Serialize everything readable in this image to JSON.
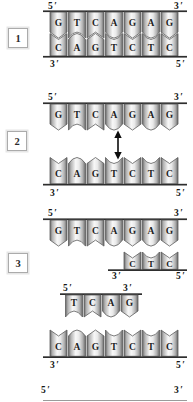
{
  "colors": {
    "background": "#ffffff",
    "backbone_line": "#2e2e2e",
    "tile_edge": "#696969",
    "tile_highlight": "#f8f8f8",
    "letter": "#1e1e1e"
  },
  "steps": [
    {
      "number": "1",
      "top_strand": {
        "label_left": "5′",
        "label_right": "3′",
        "bases": [
          "G",
          "T",
          "C",
          "A",
          "G",
          "A",
          "G"
        ]
      },
      "bottom_strand": {
        "label_left": "3′",
        "label_right": "5′",
        "bases": [
          "C",
          "A",
          "G",
          "T",
          "C",
          "T",
          "C"
        ]
      }
    },
    {
      "number": "2",
      "top_strand": {
        "label_left": "5′",
        "label_right": "3′",
        "bases": [
          "G",
          "T",
          "C",
          "A",
          "G",
          "A",
          "G"
        ]
      },
      "bottom_strand": {
        "label_left": "3′",
        "label_right": "5′",
        "bases": [
          "C",
          "A",
          "G",
          "T",
          "C",
          "T",
          "C"
        ]
      },
      "separation_arrow": "double-headed-vertical"
    },
    {
      "number": "3",
      "upper": {
        "top_strand": {
          "label_left": "5′",
          "label_right": "3′",
          "bases": [
            "G",
            "T",
            "C",
            "A",
            "G",
            "A",
            "G"
          ]
        },
        "primer": {
          "label_left": "3′",
          "label_right": "5′",
          "bases": [
            "C",
            "T",
            "C"
          ],
          "anneal_columns": [
            5,
            6,
            7
          ]
        }
      },
      "lower": {
        "primer": {
          "label_left": "5′",
          "label_right": "3′",
          "bases": [
            "T",
            "C",
            "A",
            "G"
          ],
          "anneal_columns": [
            2,
            3,
            4,
            5
          ]
        },
        "bottom_strand": {
          "label_left": "3′",
          "label_right": "5′",
          "bases": [
            "C",
            "A",
            "G",
            "T",
            "C",
            "T",
            "C"
          ]
        }
      }
    }
  ],
  "next_panel": {
    "label_left": "5′",
    "label_right": "3′"
  }
}
